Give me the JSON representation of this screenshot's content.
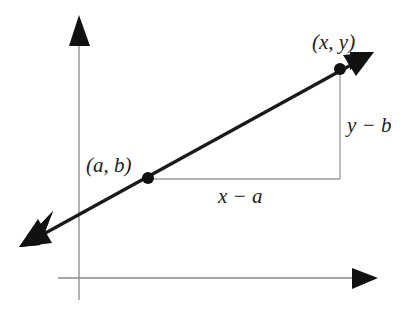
{
  "caption_fragment": "",
  "diagram": {
    "type": "slope-triangle",
    "points": [
      {
        "label": "(a, b)"
      },
      {
        "label": "(x, y)"
      }
    ],
    "run_label": "x − a",
    "rise_label": "y − b",
    "colors": {
      "line": "#1a1a1a",
      "axis": "#888888",
      "leg": "#999999",
      "text": "#222222"
    }
  }
}
